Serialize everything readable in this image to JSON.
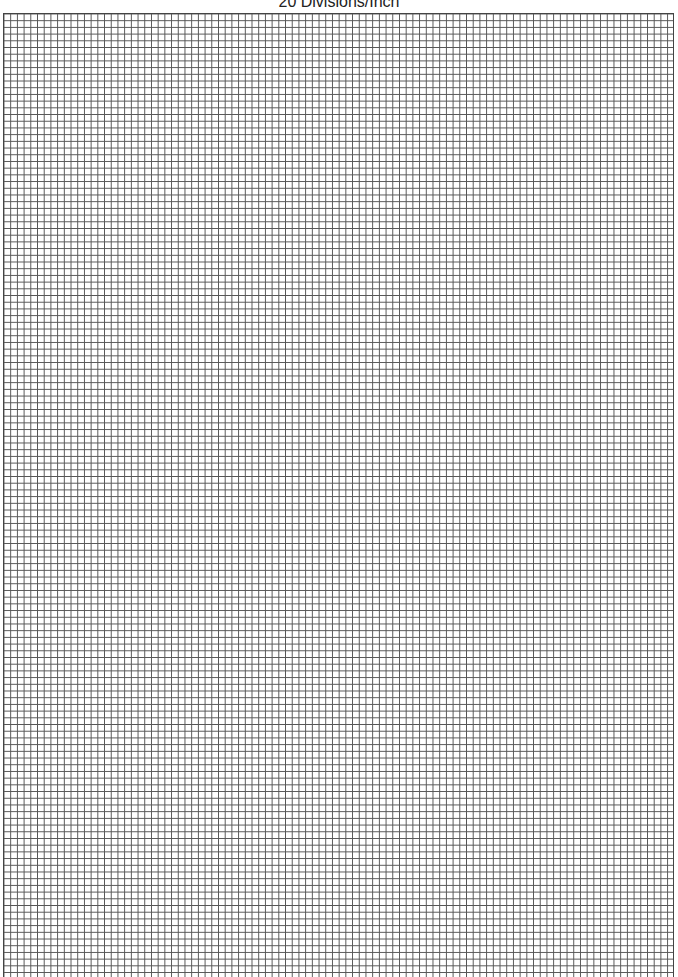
{
  "page": {
    "title": "20 Divisions/Inch"
  },
  "grid": {
    "divisions_per_inch": 20,
    "line_color": "#555555",
    "background_color": "#ffffff"
  }
}
